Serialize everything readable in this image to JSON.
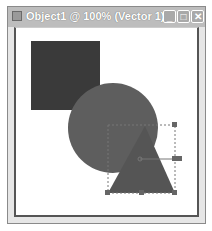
{
  "window": {
    "title": "Object1 @ 100% (Vector 1)",
    "controls": {
      "minimize": "_",
      "maximize": "□",
      "close": "✕"
    }
  },
  "canvas": {
    "shapes": [
      {
        "type": "rectangle",
        "fill": "#3a3a3a"
      },
      {
        "type": "circle",
        "fill": "#5e5e5e"
      },
      {
        "type": "triangle",
        "fill": "#555555",
        "selected": true
      }
    ],
    "selection": {
      "style": "dashed bounding box with handles",
      "color": "#6a6a6a"
    }
  }
}
